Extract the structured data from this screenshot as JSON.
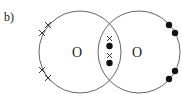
{
  "figure": {
    "label": "b)",
    "top_cropped_text": "",
    "atoms": [
      {
        "symbol": "O",
        "cx": 80,
        "cy": 52,
        "r": 41
      },
      {
        "symbol": "O",
        "cx": 139,
        "cy": 52,
        "r": 41
      }
    ],
    "left_lone_electrons": "crosses",
    "right_lone_electrons": "dots",
    "shared_pairs": [
      "cross",
      "dot",
      "cross",
      "dot"
    ],
    "colors": {
      "line": "#555555",
      "electron": "#111111"
    }
  }
}
